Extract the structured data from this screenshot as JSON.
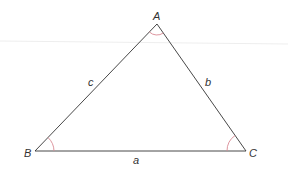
{
  "diagram": {
    "type": "triangle",
    "vertices": [
      {
        "name": "A",
        "label": "A"
      },
      {
        "name": "B",
        "label": "B"
      },
      {
        "name": "C",
        "label": "C"
      }
    ],
    "sides": [
      {
        "name": "a",
        "label": "a",
        "opposite": "A"
      },
      {
        "name": "b",
        "label": "b",
        "opposite": "B"
      },
      {
        "name": "c",
        "label": "c",
        "opposite": "C"
      }
    ],
    "angle_marks": [
      "A",
      "B",
      "C"
    ]
  },
  "colors": {
    "line": "#333333",
    "angle_arc": "#d98a94",
    "guide_line": "#eeeeee",
    "background": "#ffffff"
  }
}
